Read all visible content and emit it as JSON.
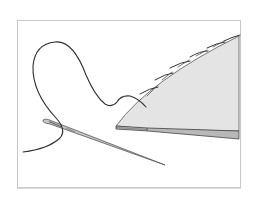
{
  "illustration": {
    "subject": "needle and thread stitching the edge of folded fabric",
    "elements": [
      "frame",
      "fabric",
      "stitches",
      "thread",
      "needle"
    ],
    "colors": {
      "frame_border": "#c9c9c9",
      "fabric_top": "#e4e4e4",
      "fabric_edge": "#b8b8b8",
      "outline": "#3a3a3a",
      "thread": "#2f2f2f",
      "needle": "#bdbdbd"
    }
  }
}
